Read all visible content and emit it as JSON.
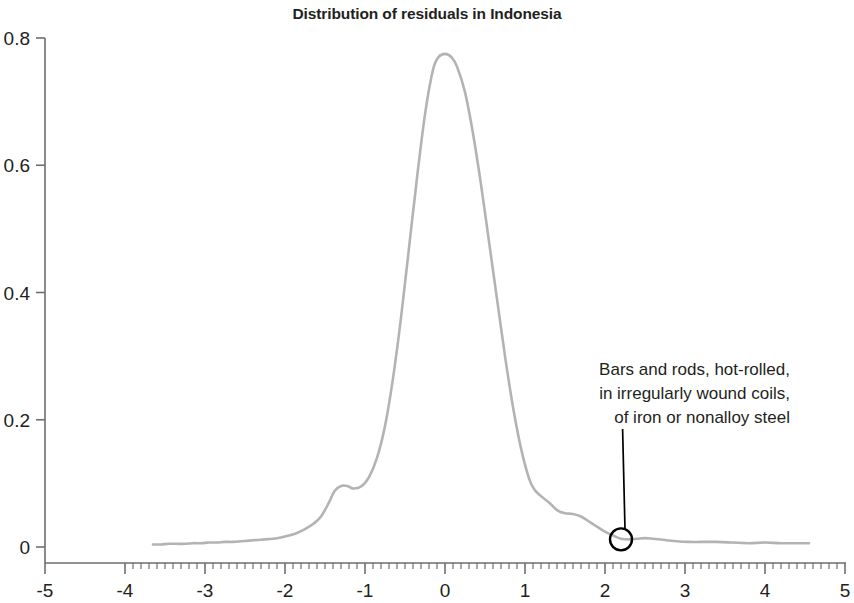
{
  "chart_data": {
    "type": "line",
    "title": "Distribution of residuals in Indonesia",
    "xlabel": "",
    "ylabel": "",
    "xlim": [
      -5,
      5
    ],
    "ylim": [
      0,
      0.8
    ],
    "grid": false,
    "legend": null,
    "x_ticks": [
      "-5",
      "-4",
      "-3",
      "-2",
      "-1",
      "0",
      "1",
      "2",
      "3",
      "4",
      "5"
    ],
    "x_tick_values": [
      -5,
      -4,
      -3,
      -2,
      -1,
      0,
      1,
      2,
      3,
      4,
      5
    ],
    "y_ticks": [
      "0",
      "0.2",
      "0.4",
      "0.6",
      "0.8"
    ],
    "y_tick_values": [
      0,
      0.2,
      0.4,
      0.6,
      0.8
    ],
    "minor_tick_interval": 0.1,
    "minor_tick_range": [
      -4,
      5
    ],
    "series": [
      {
        "name": "Kernel density of residuals",
        "color": "#b3b3b3",
        "x": [
          -3.65,
          -3.55,
          -3.45,
          -3.35,
          -3.25,
          -3.15,
          -3.05,
          -2.95,
          -2.85,
          -2.75,
          -2.65,
          -2.55,
          -2.45,
          -2.35,
          -2.25,
          -2.15,
          -2.05,
          -1.95,
          -1.85,
          -1.75,
          -1.65,
          -1.55,
          -1.45,
          -1.38,
          -1.3,
          -1.22,
          -1.15,
          -1.05,
          -0.95,
          -0.85,
          -0.75,
          -0.65,
          -0.55,
          -0.45,
          -0.35,
          -0.25,
          -0.15,
          -0.08,
          0.0,
          0.08,
          0.15,
          0.25,
          0.35,
          0.45,
          0.55,
          0.65,
          0.75,
          0.85,
          0.95,
          1.05,
          1.12,
          1.2,
          1.3,
          1.4,
          1.5,
          1.6,
          1.7,
          1.8,
          1.9,
          2.0,
          2.1,
          2.2,
          2.3,
          2.4,
          2.5,
          2.6,
          2.75,
          2.9,
          3.05,
          3.2,
          3.4,
          3.6,
          3.8,
          4.0,
          4.2,
          4.4,
          4.55
        ],
        "y": [
          0.004,
          0.004,
          0.005,
          0.005,
          0.005,
          0.006,
          0.006,
          0.007,
          0.007,
          0.008,
          0.008,
          0.009,
          0.01,
          0.011,
          0.012,
          0.013,
          0.015,
          0.018,
          0.022,
          0.028,
          0.036,
          0.048,
          0.07,
          0.088,
          0.096,
          0.096,
          0.092,
          0.095,
          0.11,
          0.14,
          0.19,
          0.265,
          0.36,
          0.47,
          0.58,
          0.68,
          0.75,
          0.77,
          0.775,
          0.77,
          0.755,
          0.715,
          0.65,
          0.57,
          0.48,
          0.39,
          0.3,
          0.22,
          0.155,
          0.108,
          0.09,
          0.08,
          0.07,
          0.058,
          0.053,
          0.052,
          0.048,
          0.04,
          0.032,
          0.024,
          0.018,
          0.013,
          0.012,
          0.013,
          0.014,
          0.013,
          0.011,
          0.009,
          0.008,
          0.008,
          0.008,
          0.007,
          0.006,
          0.007,
          0.006,
          0.006,
          0.006
        ]
      }
    ],
    "annotations": [
      {
        "text_lines": [
          "Bars and rods, hot-rolled,",
          "in irregularly wound coils,",
          "of iron or nonalloy steel"
        ],
        "point": [
          2.2,
          0.012
        ],
        "marker": "circle-outline",
        "marker_color": "#000000",
        "text_anchor": [
          2.47,
          0.195
        ]
      }
    ],
    "axis_color": "#6e6e6e",
    "text_color": "#231f20"
  }
}
